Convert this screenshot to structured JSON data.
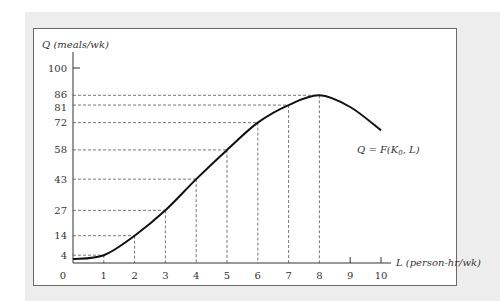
{
  "chart_data": {
    "type": "line",
    "title": "",
    "xlabel": "L (person-hr/wk)",
    "ylabel": "Q (meals/wk)",
    "curve_label": "Q = F(K0, L)",
    "curve_label_parts": {
      "prefix": "Q = F(K",
      "subscript": "0",
      "suffix": ", L)"
    },
    "xlim": [
      0,
      10
    ],
    "ylim": [
      0,
      100
    ],
    "x_ticks": [
      "0",
      "1",
      "2",
      "3",
      "4",
      "5",
      "6",
      "7",
      "8",
      "9",
      "10"
    ],
    "y_ticks": [
      "4",
      "14",
      "27",
      "43",
      "58",
      "72",
      "81",
      "86",
      "100"
    ],
    "series": [
      {
        "name": "Q = F(K0, L)",
        "x": [
          0,
          1,
          2,
          3,
          4,
          5,
          6,
          7,
          8,
          9,
          10
        ],
        "values": [
          2,
          4,
          14,
          27,
          43,
          58,
          72,
          81,
          86,
          80,
          68
        ]
      }
    ],
    "guide_lines": {
      "x": [
        1,
        2,
        3,
        4,
        5,
        6,
        7,
        8
      ],
      "y": [
        4,
        14,
        27,
        43,
        58,
        72,
        81,
        86
      ]
    },
    "grid": false,
    "legend": "none"
  },
  "colors": {
    "panel_bg": "#ededed",
    "frame_bg": "#ffffff",
    "curve": "#111111",
    "guides": "#555555",
    "axis": "#333333"
  }
}
